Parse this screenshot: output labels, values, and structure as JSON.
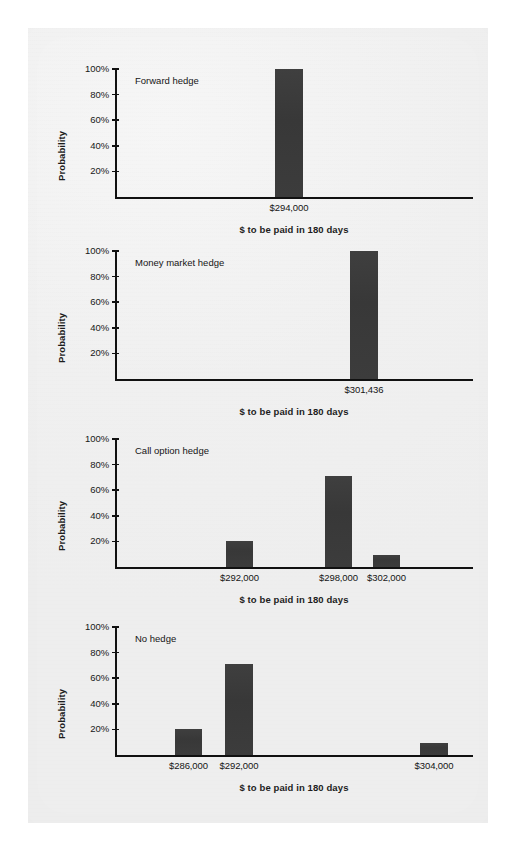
{
  "page": {
    "background_color": "#ffffff",
    "sheet_color": "#f0f0f0",
    "bar_color": "#3b3b3b",
    "axis_color": "#111111"
  },
  "common": {
    "y_axis_title": "Probability",
    "x_axis_title": "$ to be paid in 180 days",
    "y_ticks": [
      "100%",
      "80%",
      "60%",
      "40%",
      "20%"
    ]
  },
  "chart_data": [
    {
      "type": "bar",
      "title": "Forward hedge",
      "xlabel": "$ to be paid in 180 days",
      "ylabel": "Probability",
      "ylim": [
        0,
        100
      ],
      "yticks": [
        20,
        40,
        60,
        80,
        100
      ],
      "ytick_labels": [
        "20%",
        "40%",
        "60%",
        "80%",
        "100%"
      ],
      "grid": false,
      "legend": "none",
      "categories": [
        "$294,000"
      ],
      "values": [
        100
      ]
    },
    {
      "type": "bar",
      "title": "Money market hedge",
      "xlabel": "$ to be paid in 180 days",
      "ylabel": "Probability",
      "ylim": [
        0,
        100
      ],
      "yticks": [
        20,
        40,
        60,
        80,
        100
      ],
      "ytick_labels": [
        "20%",
        "40%",
        "60%",
        "80%",
        "100%"
      ],
      "grid": false,
      "legend": "none",
      "categories": [
        "$301,436"
      ],
      "values": [
        100
      ]
    },
    {
      "type": "bar",
      "title": "Call option hedge",
      "xlabel": "$ to be paid in 180 days",
      "ylabel": "Probability",
      "ylim": [
        0,
        100
      ],
      "yticks": [
        20,
        40,
        60,
        80,
        100
      ],
      "ytick_labels": [
        "20%",
        "40%",
        "60%",
        "80%",
        "100%"
      ],
      "grid": false,
      "legend": "none",
      "categories": [
        "$292,000",
        "$298,000",
        "$302,000"
      ],
      "values": [
        20,
        71,
        9
      ]
    },
    {
      "type": "bar",
      "title": "No hedge",
      "xlabel": "$ to be paid in 180 days",
      "ylabel": "Probability",
      "ylim": [
        0,
        100
      ],
      "yticks": [
        20,
        40,
        60,
        80,
        100
      ],
      "ytick_labels": [
        "20%",
        "40%",
        "60%",
        "80%",
        "100%"
      ],
      "grid": false,
      "legend": "none",
      "categories": [
        "$286,000",
        "$292,000",
        "$304,000"
      ],
      "values": [
        20,
        71,
        9
      ]
    }
  ],
  "layout": {
    "charts": [
      {
        "top": 12,
        "plot_height": 160,
        "axis_x": 87,
        "axis_top": 29,
        "axis_bottom": 157,
        "axis_right": 445,
        "bars": [
          {
            "left": 247,
            "width": 28
          }
        ],
        "cat_label_y": 162,
        "x_title_y": 184
      },
      {
        "top": 194,
        "plot_height": 160,
        "axis_x": 87,
        "axis_top": 29,
        "axis_bottom": 157,
        "axis_right": 445,
        "bars": [
          {
            "left": 322,
            "width": 28
          }
        ],
        "cat_label_y": 162,
        "x_title_y": 184
      },
      {
        "top": 382,
        "plot_height": 160,
        "axis_x": 87,
        "axis_top": 29,
        "axis_bottom": 157,
        "axis_right": 445,
        "bars": [
          {
            "left": 198,
            "width": 27
          },
          {
            "left": 297,
            "width": 27
          },
          {
            "left": 345,
            "width": 27
          }
        ],
        "cat_label_y": 162,
        "x_title_y": 184
      },
      {
        "top": 570,
        "plot_height": 160,
        "axis_x": 87,
        "axis_top": 29,
        "axis_bottom": 157,
        "axis_right": 445,
        "bars": [
          {
            "left": 147,
            "width": 27
          },
          {
            "left": 197,
            "width": 28
          },
          {
            "left": 392,
            "width": 28
          }
        ],
        "cat_label_y": 162,
        "x_title_y": 184
      }
    ]
  }
}
